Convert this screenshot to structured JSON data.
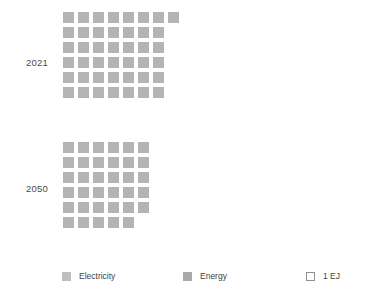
{
  "chart_data": {
    "type": "bar",
    "title": "",
    "subtitle": "",
    "xlabel": "",
    "ylabel": "",
    "unit": "1 EJ",
    "unit_note": "each square represents 1 EJ",
    "grid": false,
    "legend_position": "bottom",
    "categories": [
      "2021",
      "2050"
    ],
    "values": [
      43,
      35
    ],
    "series": [
      {
        "name": "Energy",
        "values": [
          43,
          35
        ]
      }
    ],
    "rows": [
      {
        "category": "2021",
        "total_squares": 43,
        "row_counts": [
          8,
          7,
          7,
          7,
          7,
          7
        ]
      },
      {
        "category": "2050",
        "total_squares": 35,
        "row_counts": [
          6,
          6,
          6,
          6,
          6,
          5
        ]
      }
    ],
    "legend_entries": [
      "Electricity",
      "Energy",
      "1 EJ"
    ],
    "colors": {
      "cell": "#b4b4b4",
      "electricity_swatch": "#bfbfbf",
      "energy_swatch": "#a9a9a9",
      "unit_swatch_outline": "#8f8f8f",
      "background": "#ffffff",
      "label_text": "#4a4a4a"
    }
  },
  "groups": [
    {
      "label": "2021"
    },
    {
      "label": "2050"
    }
  ],
  "legend": {
    "electricity": {
      "label": "Electricity"
    },
    "energy": {
      "label": "Energy"
    },
    "unit": {
      "label": "1 EJ"
    }
  }
}
